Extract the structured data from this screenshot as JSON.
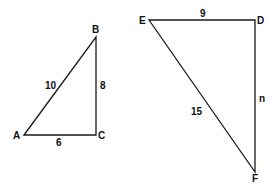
{
  "diagram": {
    "type": "similar-right-triangles",
    "triangles": [
      {
        "name": "ABC",
        "vertices": [
          {
            "label": "A",
            "x": 24,
            "y": 135
          },
          {
            "label": "B",
            "x": 96,
            "y": 37
          },
          {
            "label": "C",
            "x": 96,
            "y": 135
          }
        ],
        "sides": {
          "AB": "10",
          "BC": "8",
          "AC": "6"
        }
      },
      {
        "name": "DEF",
        "vertices": [
          {
            "label": "E",
            "x": 149,
            "y": 20
          },
          {
            "label": "D",
            "x": 255,
            "y": 20
          },
          {
            "label": "F",
            "x": 255,
            "y": 172
          }
        ],
        "sides": {
          "ED": "9",
          "EF": "15",
          "DF": "n"
        }
      }
    ]
  }
}
